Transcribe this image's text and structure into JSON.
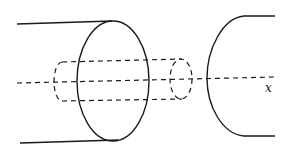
{
  "diagram": {
    "axis_label": "x",
    "colors": {
      "stroke": "#1a1a1a",
      "background": "#ffffff"
    }
  }
}
